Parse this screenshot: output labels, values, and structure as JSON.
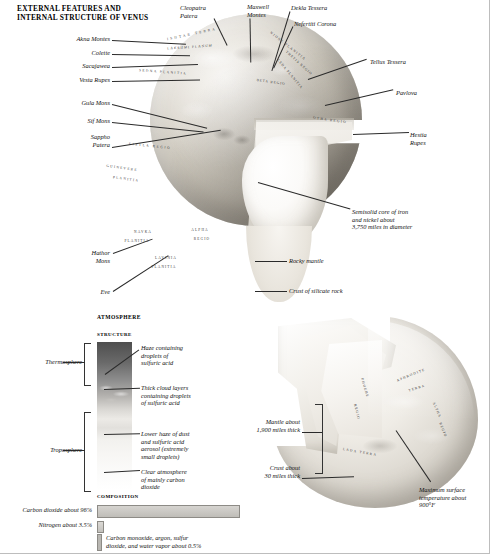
{
  "title": "EXTERNAL FEATURES AND\nINTERNAL STRUCTURE OF VENUS",
  "globe_labels": {
    "akna_montes": "Akna Montes",
    "colette": "Colette",
    "sacajawea": "Sacajawea",
    "vesta_rupes": "Vesta Rupes",
    "gula_mons": "Gula Mons",
    "sif_mons": "Sif Mons",
    "sappho_patera": "Sappho\nPatera",
    "hathor_mons": "Hathor\nMons",
    "eve": "Eve",
    "cleopatra_patera": "Cleopatra\nPatera",
    "maxwell_montes": "Maxwell\nMontes",
    "dekla_tessera": "Dekla Tessera",
    "nefertiti_corona": "Nefertiti Corona",
    "tellus_tessera": "Tellus Tessera",
    "pavlova": "Pavlova",
    "hestia_rupes": "Hestia\nRupes"
  },
  "interior_labels": {
    "core": "Semisolid core of iron\nand nickel about\n3,750 miles in diameter",
    "mantle": "Rocky mantle",
    "crust": "Crust of silicate rock"
  },
  "map_regions": [
    {
      "name": "ISHTAR TERRA",
      "x": 192,
      "y": 34,
      "rot": -12,
      "spacing": 2.2
    },
    {
      "name": "LAKSHMI PLANUM",
      "x": 190,
      "y": 47,
      "rot": -4,
      "spacing": 1.0
    },
    {
      "name": "SEDNA PLANITIA",
      "x": 163,
      "y": 72,
      "rot": 4,
      "spacing": 1.4
    },
    {
      "name": "NIOBE PLANITIA",
      "x": 288,
      "y": 46,
      "rot": 38,
      "spacing": 1.2
    },
    {
      "name": "THETIS REGIO",
      "x": 299,
      "y": 63,
      "rot": 42,
      "spacing": 0.9
    },
    {
      "name": "LEDA PLANITIA",
      "x": 290,
      "y": 74,
      "rot": 50,
      "spacing": 0.9
    },
    {
      "name": "BETA REGIO",
      "x": 271,
      "y": 82,
      "rot": 8,
      "spacing": 0.9
    },
    {
      "name": "OTHA REGIO",
      "x": 330,
      "y": 120,
      "rot": 8,
      "spacing": 1.3
    },
    {
      "name": "EISTLA REGIO",
      "x": 150,
      "y": 146,
      "rot": 6,
      "spacing": 1.6
    },
    {
      "name": "GUINEVERE",
      "x": 122,
      "y": 168,
      "rot": 8,
      "spacing": 1.3
    },
    {
      "name": "PLANITIA",
      "x": 126,
      "y": 179,
      "rot": 8,
      "spacing": 1.3
    },
    {
      "name": "NAVKA",
      "x": 143,
      "y": 232,
      "rot": 0,
      "spacing": 1.2
    },
    {
      "name": "PLANITIA",
      "x": 137,
      "y": 241,
      "rot": 0,
      "spacing": 1.1
    },
    {
      "name": "ALPHA",
      "x": 200,
      "y": 230,
      "rot": 0,
      "spacing": 1.2
    },
    {
      "name": "REGIO",
      "x": 202,
      "y": 239,
      "rot": 0,
      "spacing": 1.2
    },
    {
      "name": "LAVINIA",
      "x": 166,
      "y": 258,
      "rot": 0,
      "spacing": 1.1
    },
    {
      "name": "PLANITIA",
      "x": 164,
      "y": 267,
      "rot": 0,
      "spacing": 1.1
    }
  ],
  "map_regions2": [
    {
      "name": "APHRODITE",
      "x": 411,
      "y": 375,
      "rot": -22,
      "spacing": 1.2
    },
    {
      "name": "TERRA",
      "x": 417,
      "y": 388,
      "rot": -18,
      "spacing": 1.2
    },
    {
      "name": "PHOEBE",
      "x": 365,
      "y": 388,
      "rot": 74,
      "spacing": 1.1
    },
    {
      "name": "REGIO",
      "x": 357,
      "y": 412,
      "rot": 76,
      "spacing": 1.1
    },
    {
      "name": "ALPHA",
      "x": 437,
      "y": 410,
      "rot": 66,
      "spacing": 1.0
    },
    {
      "name": "REGIO",
      "x": 443,
      "y": 430,
      "rot": 68,
      "spacing": 1.0
    },
    {
      "name": "LADA TERRA",
      "x": 360,
      "y": 452,
      "rot": 10,
      "spacing": 1.3
    }
  ],
  "atmosphere": {
    "heading": "ATMOSPHERE",
    "structure_caption": "STRUCTURE",
    "composition_caption": "COMPOSITION",
    "thermosphere": "Thermosphere",
    "troposphere": "Troposphere",
    "layers": {
      "haze": "Haze containing\ndroplets of\nsulfuric acid",
      "cloud": "Thick cloud layers\ncontaining droplets\nof sulfuric acid",
      "lower_haze": "Lower haze of dust\nand sulfuric acid\naerosol (extremely\nsmall droplets)",
      "clear": "Clear atmosphere\nof mainly carbon\ndioxide"
    },
    "composition": {
      "co2": "Carbon dioxide about 96%",
      "n2": "Nitrogen about 3.5%",
      "trace": "Carbon monoxide, argon, sulfur\ndioxide, and water vapor about 0.5%"
    }
  },
  "cutaway2": {
    "mantle": "Mantle about\n1,900 miles thick",
    "crust": "Crust about\n30 miles thick",
    "temperature": "Maximum surface\ntemperature about\n900°F"
  }
}
